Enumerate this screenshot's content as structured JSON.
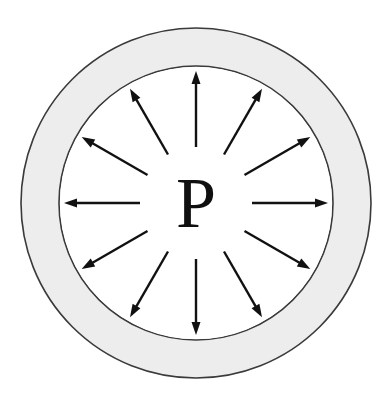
{
  "figure": {
    "type": "diagram",
    "width": 388,
    "height": 398,
    "background_color": "#ffffff"
  },
  "center_label": {
    "text": "P",
    "meaning": "pressure",
    "color": "#101010",
    "font_size": 72,
    "center_x": 196,
    "center_y": 203
  },
  "annulus": {
    "name": "vessel-wall",
    "center_x": 196,
    "center_y": 203,
    "outer_radius": 175,
    "inner_radius": 137,
    "fill_color": "#ededed",
    "stroke_color": "#3a3a3a",
    "stroke_width": 1.6
  },
  "interior": {
    "name": "vessel-interior",
    "fill_color": "#ffffff"
  },
  "arrows": {
    "count": 12,
    "angle_step_degrees": 30,
    "tail_radius": 56,
    "tip_radius": 132,
    "shaft_width": 2.4,
    "head_length": 13,
    "head_width": 9,
    "color": "#111111",
    "direction": "outward-radial",
    "angles_degrees": [
      90,
      60,
      30,
      0,
      330,
      300,
      270,
      240,
      210,
      180,
      150,
      120
    ],
    "labels": [
      "arrow-up",
      "arrow-up-right-steep",
      "arrow-up-right-shallow",
      "arrow-right",
      "arrow-down-right-shallow",
      "arrow-down-right-steep",
      "arrow-down",
      "arrow-down-left-steep",
      "arrow-down-left-shallow",
      "arrow-left",
      "arrow-up-left-shallow",
      "arrow-up-left-steep"
    ]
  }
}
